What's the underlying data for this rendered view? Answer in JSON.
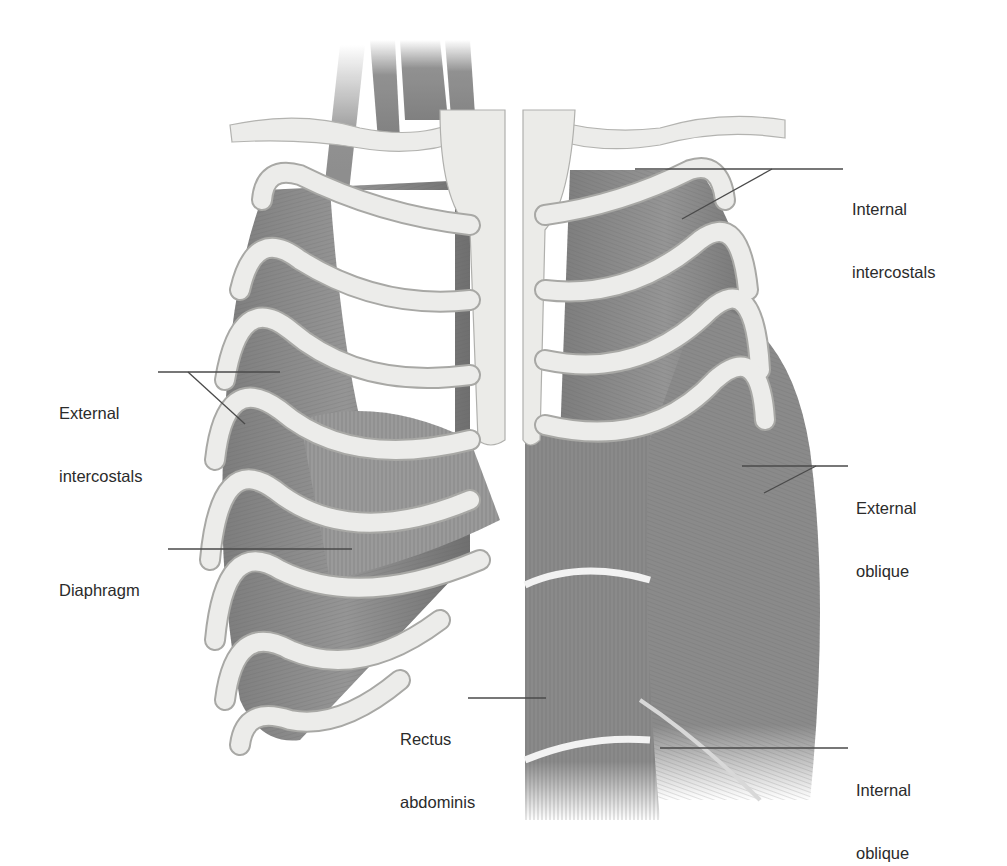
{
  "figure": {
    "colors": {
      "background": "#ffffff",
      "bone": "#e9e9e6",
      "bone_edge": "#a9a9a6",
      "muscle": "#8a8a8a",
      "muscle_dark": "#6b6b6b",
      "leader_line": "#4a4a4a",
      "label_text": "#2b2b2b"
    }
  },
  "labels": {
    "internal_intercostals": {
      "line1": "Internal",
      "line2": "intercostals"
    },
    "external_intercostals": {
      "line1": "External",
      "line2": "intercostals"
    },
    "diaphragm": {
      "line1": "Diaphragm"
    },
    "external_oblique": {
      "line1": "External",
      "line2": "oblique"
    },
    "rectus_abdominis": {
      "line1": "Rectus",
      "line2": "abdominis"
    },
    "internal_oblique": {
      "line1": "Internal",
      "line2": "oblique"
    }
  }
}
